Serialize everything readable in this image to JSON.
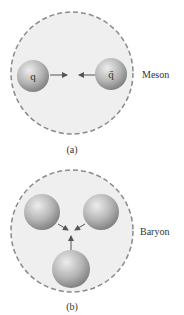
{
  "panel_a": {
    "caption": "(a)",
    "label": "Meson",
    "quark_left": "q",
    "quark_right": "q̄"
  },
  "panel_b": {
    "caption": "(b)",
    "label": "Baryon"
  },
  "colors": {
    "region_fill": "#efefef",
    "dash_stroke": "#8a8a8a",
    "sphere_light": "#e6e6e6",
    "sphere_dark": "#7a7a7a",
    "arrow": "#555555"
  }
}
